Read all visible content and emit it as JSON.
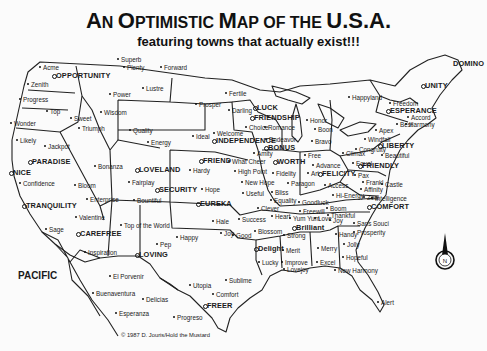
{
  "title": {
    "line1_parts": [
      "A",
      "N ",
      "O",
      "PTIMISTIC ",
      "M",
      "AP OF THE ",
      "U.S.A."
    ],
    "line2": "featuring towns that actually exist!!!"
  },
  "labels": [
    {
      "text": "Superb",
      "x": 121,
      "y": 56,
      "mk": "dot",
      "big": false
    },
    {
      "text": "Plenty",
      "x": 127,
      "y": 64,
      "mk": "dot",
      "big": false
    },
    {
      "text": "Forward",
      "x": 164,
      "y": 64,
      "mk": "dot",
      "big": false
    },
    {
      "text": "Acme",
      "x": 43,
      "y": 64,
      "mk": "dot",
      "big": false
    },
    {
      "text": "OPPORTUNITY",
      "x": 56,
      "y": 72,
      "mk": "ring",
      "big": true
    },
    {
      "text": "Zenith",
      "x": 31,
      "y": 81,
      "mk": "dot",
      "big": false
    },
    {
      "text": "Lustre",
      "x": 146,
      "y": 85,
      "mk": "dot",
      "big": false
    },
    {
      "text": "Power",
      "x": 113,
      "y": 91,
      "mk": "dot",
      "big": false
    },
    {
      "text": "Progress",
      "x": 23,
      "y": 96,
      "mk": "dot",
      "big": false
    },
    {
      "text": "Top",
      "x": 50,
      "y": 108,
      "mk": "dot",
      "big": false
    },
    {
      "text": "Wisdom",
      "x": 104,
      "y": 109,
      "mk": "dot",
      "big": false
    },
    {
      "text": "Sweet",
      "x": 74,
      "y": 115,
      "mk": "dot",
      "big": false
    },
    {
      "text": "Triumph",
      "x": 82,
      "y": 125,
      "mk": "dot",
      "big": false
    },
    {
      "text": "Wonder",
      "x": 14,
      "y": 120,
      "mk": "dot",
      "big": false
    },
    {
      "text": "Quality",
      "x": 133,
      "y": 127,
      "mk": "dot",
      "big": false
    },
    {
      "text": "Energy",
      "x": 151,
      "y": 139,
      "mk": "dot",
      "big": false
    },
    {
      "text": "Likely",
      "x": 20,
      "y": 137,
      "mk": "dot",
      "big": false
    },
    {
      "text": "Jackpot",
      "x": 48,
      "y": 143,
      "mk": "dot",
      "big": false
    },
    {
      "text": "PARADISE",
      "x": 32,
      "y": 158,
      "mk": "ring",
      "big": true
    },
    {
      "text": "NICE",
      "x": 13,
      "y": 169,
      "mk": "ring",
      "big": true
    },
    {
      "text": "Confidence",
      "x": 23,
      "y": 180,
      "mk": "dot",
      "big": false
    },
    {
      "text": "TRANQUILITY",
      "x": 26,
      "y": 202,
      "mk": "ring",
      "big": true
    },
    {
      "text": "Sage",
      "x": 49,
      "y": 226,
      "mk": "dot",
      "big": false
    },
    {
      "text": "Bonanza",
      "x": 98,
      "y": 163,
      "mk": "dot",
      "big": false
    },
    {
      "text": "Bloom",
      "x": 78,
      "y": 182,
      "mk": "dot",
      "big": false
    },
    {
      "text": "Enterprise",
      "x": 90,
      "y": 196,
      "mk": "dot",
      "big": false
    },
    {
      "text": "Valentine",
      "x": 79,
      "y": 214,
      "mk": "dot",
      "big": false
    },
    {
      "text": "CAREFREE",
      "x": 80,
      "y": 230,
      "mk": "ring",
      "big": true
    },
    {
      "text": "Inspiration",
      "x": 88,
      "y": 249,
      "mk": "dot",
      "big": false
    },
    {
      "text": "LOVELAND",
      "x": 139,
      "y": 166,
      "mk": "ring",
      "big": true
    },
    {
      "text": "Fairplay",
      "x": 132,
      "y": 179,
      "mk": "dot",
      "big": false
    },
    {
      "text": "SECURITY",
      "x": 159,
      "y": 186,
      "mk": "ring",
      "big": true
    },
    {
      "text": "Bountiful",
      "x": 137,
      "y": 197,
      "mk": "dot",
      "big": false
    },
    {
      "text": "Top of the World",
      "x": 124,
      "y": 222,
      "mk": "dot",
      "big": false
    },
    {
      "text": "Pep",
      "x": 160,
      "y": 241,
      "mk": "dot",
      "big": false
    },
    {
      "text": "LOVING",
      "x": 139,
      "y": 251,
      "mk": "ring",
      "big": true
    },
    {
      "text": "Happy",
      "x": 180,
      "y": 234,
      "mk": "dot",
      "big": false
    },
    {
      "text": "Ideal",
      "x": 196,
      "y": 133,
      "mk": "dot",
      "big": false
    },
    {
      "text": "Welcome",
      "x": 217,
      "y": 130,
      "mk": "dot",
      "big": false
    },
    {
      "text": "INDEPENDENCE",
      "x": 216,
      "y": 137,
      "mk": "ring",
      "big": true
    },
    {
      "text": "FRIEND",
      "x": 203,
      "y": 157,
      "mk": "ring",
      "big": true
    },
    {
      "text": "What Cheer",
      "x": 232,
      "y": 158,
      "mk": "dot",
      "big": false
    },
    {
      "text": "Hardy",
      "x": 193,
      "y": 167,
      "mk": "dot",
      "big": false
    },
    {
      "text": "High Point",
      "x": 238,
      "y": 168,
      "mk": "dot",
      "big": false
    },
    {
      "text": "Hope",
      "x": 205,
      "y": 186,
      "mk": "dot",
      "big": false
    },
    {
      "text": "EUREKA",
      "x": 200,
      "y": 200,
      "mk": "ring",
      "big": true
    },
    {
      "text": "Prosper",
      "x": 199,
      "y": 101,
      "mk": "dot",
      "big": false
    },
    {
      "text": "Fertile",
      "x": 229,
      "y": 90,
      "mk": "dot",
      "big": false
    },
    {
      "text": "Darling",
      "x": 232,
      "y": 107,
      "mk": "dot",
      "big": false
    },
    {
      "text": "LUCK",
      "x": 257,
      "y": 104,
      "mk": "ring",
      "big": true
    },
    {
      "text": "FRIENDSHIP",
      "x": 254,
      "y": 114,
      "mk": "ring",
      "big": true
    },
    {
      "text": "Choice",
      "x": 249,
      "y": 124,
      "mk": "dot",
      "big": false
    },
    {
      "text": "Romance",
      "x": 268,
      "y": 124,
      "mk": "dot",
      "big": false
    },
    {
      "text": "Endeavor",
      "x": 269,
      "y": 136,
      "mk": "dot",
      "big": false
    },
    {
      "text": "BONUS",
      "x": 268,
      "y": 144,
      "mk": "ring",
      "big": true
    },
    {
      "text": "Amity",
      "x": 257,
      "y": 150,
      "mk": "dot",
      "big": false
    },
    {
      "text": "WORTH",
      "x": 277,
      "y": 158,
      "mk": "ring",
      "big": true
    },
    {
      "text": "Fidelity",
      "x": 276,
      "y": 170,
      "mk": "dot",
      "big": false
    },
    {
      "text": "New Hope",
      "x": 245,
      "y": 179,
      "mk": "dot",
      "big": false
    },
    {
      "text": "Useful",
      "x": 246,
      "y": 190,
      "mk": "dot",
      "big": false
    },
    {
      "text": "Bliss",
      "x": 275,
      "y": 189,
      "mk": "dot",
      "big": false
    },
    {
      "text": "Paragon",
      "x": 291,
      "y": 180,
      "mk": "dot",
      "big": false
    },
    {
      "text": "Equality",
      "x": 274,
      "y": 197,
      "mk": "dot",
      "big": false
    },
    {
      "text": "Goodluck",
      "x": 302,
      "y": 199,
      "mk": "dot",
      "big": false
    },
    {
      "text": "Clever",
      "x": 261,
      "y": 205,
      "mk": "dot",
      "big": false
    },
    {
      "text": "Heart",
      "x": 275,
      "y": 213,
      "mk": "dot",
      "big": false
    },
    {
      "text": "Success",
      "x": 242,
      "y": 216,
      "mk": "dot",
      "big": false
    },
    {
      "text": "Hale",
      "x": 216,
      "y": 218,
      "mk": "dot",
      "big": false
    },
    {
      "text": "Joy",
      "x": 224,
      "y": 230,
      "mk": "dot",
      "big": false
    },
    {
      "text": "Good",
      "x": 236,
      "y": 232,
      "mk": "dot",
      "big": false
    },
    {
      "text": "Blossom",
      "x": 258,
      "y": 228,
      "mk": "dot",
      "big": false
    },
    {
      "text": "Delight",
      "x": 258,
      "y": 245,
      "mk": "ring",
      "big": true
    },
    {
      "text": "Lucky",
      "x": 262,
      "y": 259,
      "mk": "dot",
      "big": false
    },
    {
      "text": "Happyland",
      "x": 352,
      "y": 94,
      "mk": "dot",
      "big": false
    },
    {
      "text": "Honor",
      "x": 310,
      "y": 117,
      "mk": "dot",
      "big": false
    },
    {
      "text": "Boon",
      "x": 318,
      "y": 126,
      "mk": "dot",
      "big": false
    },
    {
      "text": "Bravo",
      "x": 315,
      "y": 138,
      "mk": "dot",
      "big": false
    },
    {
      "text": "Free",
      "x": 308,
      "y": 152,
      "mk": "dot",
      "big": false
    },
    {
      "text": "Advance",
      "x": 316,
      "y": 162,
      "mk": "dot",
      "big": false
    },
    {
      "text": "Art",
      "x": 311,
      "y": 170,
      "mk": "dot",
      "big": false
    },
    {
      "text": "FELICITY",
      "x": 322,
      "y": 170,
      "mk": "ring",
      "big": true
    },
    {
      "text": "Access",
      "x": 328,
      "y": 182,
      "mk": "dot",
      "big": false
    },
    {
      "text": "Hi-Energy",
      "x": 336,
      "y": 192,
      "mk": "dot",
      "big": false
    },
    {
      "text": "Climax",
      "x": 346,
      "y": 150,
      "mk": "dot",
      "big": false
    },
    {
      "text": "Equal",
      "x": 356,
      "y": 160,
      "mk": "dot",
      "big": false
    },
    {
      "text": "Pax",
      "x": 358,
      "y": 172,
      "mk": "dot",
      "big": false
    },
    {
      "text": "Frankl",
      "x": 366,
      "y": 179,
      "mk": "dot",
      "big": false
    },
    {
      "text": "Affinity",
      "x": 364,
      "y": 186,
      "mk": "dot",
      "big": false
    },
    {
      "text": "Zeal",
      "x": 367,
      "y": 194,
      "mk": "dot",
      "big": false
    },
    {
      "text": "Boom",
      "x": 330,
      "y": 205,
      "mk": "dot",
      "big": false
    },
    {
      "text": "Freewill",
      "x": 303,
      "y": 208,
      "mk": "dot",
      "big": false
    },
    {
      "text": "Thankful",
      "x": 331,
      "y": 212,
      "mk": "dot",
      "big": false
    },
    {
      "text": "Yum Yum",
      "x": 293,
      "y": 215,
      "mk": "dot",
      "big": false
    },
    {
      "text": "Love",
      "x": 318,
      "y": 215,
      "mk": "dot",
      "big": false
    },
    {
      "text": "Joy",
      "x": 333,
      "y": 217,
      "mk": "dot",
      "big": false
    },
    {
      "text": "Brilliant",
      "x": 296,
      "y": 224,
      "mk": "ring",
      "big": true
    },
    {
      "text": "Strong",
      "x": 287,
      "y": 232,
      "mk": "dot",
      "big": false
    },
    {
      "text": "Merit",
      "x": 286,
      "y": 247,
      "mk": "dot",
      "big": false
    },
    {
      "text": "Merry",
      "x": 321,
      "y": 245,
      "mk": "dot",
      "big": false
    },
    {
      "text": "Improve",
      "x": 285,
      "y": 259,
      "mk": "dot",
      "big": false
    },
    {
      "text": "Excel",
      "x": 320,
      "y": 259,
      "mk": "dot",
      "big": false
    },
    {
      "text": "Lovejoy",
      "x": 287,
      "y": 266,
      "mk": "dot",
      "big": false
    },
    {
      "text": "Handy",
      "x": 339,
      "y": 231,
      "mk": "dot",
      "big": false
    },
    {
      "text": "Jolly",
      "x": 347,
      "y": 241,
      "mk": "dot",
      "big": false
    },
    {
      "text": "Hopeful",
      "x": 346,
      "y": 254,
      "mk": "dot",
      "big": false
    },
    {
      "text": "New Harmony",
      "x": 338,
      "y": 267,
      "mk": "dot",
      "big": false
    },
    {
      "text": "Alert",
      "x": 381,
      "y": 299,
      "mk": "dot",
      "big": false
    },
    {
      "text": "UNITY",
      "x": 425,
      "y": 82,
      "mk": "ring",
      "big": true
    },
    {
      "text": "DOMINO",
      "x": 453,
      "y": 60,
      "mk": "none",
      "big": true
    },
    {
      "text": "Freedom",
      "x": 393,
      "y": 100,
      "mk": "dot",
      "big": false
    },
    {
      "text": "ESPERANCE",
      "x": 390,
      "y": 107,
      "mk": "ring",
      "big": true
    },
    {
      "text": "Accord",
      "x": 411,
      "y": 114,
      "mk": "dot",
      "big": false
    },
    {
      "text": "Best",
      "x": 400,
      "y": 121,
      "mk": "dot",
      "big": false
    },
    {
      "text": "Harmony",
      "x": 409,
      "y": 121,
      "mk": "dot",
      "big": false
    },
    {
      "text": "Apex",
      "x": 379,
      "y": 127,
      "mk": "dot",
      "big": false
    },
    {
      "text": "Windfall",
      "x": 368,
      "y": 136,
      "mk": "dot",
      "big": false
    },
    {
      "text": "LIBERTY",
      "x": 382,
      "y": 142,
      "mk": "ring",
      "big": true
    },
    {
      "text": "Congruity",
      "x": 359,
      "y": 146,
      "mk": "dot",
      "big": false
    },
    {
      "text": "Beautiful",
      "x": 385,
      "y": 152,
      "mk": "dot",
      "big": false
    },
    {
      "text": "FRIENDLY",
      "x": 362,
      "y": 162,
      "mk": "ring",
      "big": true
    },
    {
      "text": "Castle",
      "x": 385,
      "y": 181,
      "mk": "dot",
      "big": false
    },
    {
      "text": "Intelligence",
      "x": 375,
      "y": 195,
      "mk": "dot",
      "big": false
    },
    {
      "text": "COMFORT",
      "x": 371,
      "y": 203,
      "mk": "ring",
      "big": true
    },
    {
      "text": "Sans Souci",
      "x": 357,
      "y": 220,
      "mk": "dot",
      "big": false
    },
    {
      "text": "Prosperity",
      "x": 357,
      "y": 229,
      "mk": "dot",
      "big": false
    },
    {
      "text": "El Porvenir",
      "x": 113,
      "y": 273,
      "mk": "dot",
      "big": false
    },
    {
      "text": "Buenaventura",
      "x": 96,
      "y": 290,
      "mk": "dot",
      "big": false
    },
    {
      "text": "Delicias",
      "x": 146,
      "y": 296,
      "mk": "dot",
      "big": false
    },
    {
      "text": "Esperanza",
      "x": 119,
      "y": 310,
      "mk": "dot",
      "big": false
    },
    {
      "text": "Utopia",
      "x": 193,
      "y": 282,
      "mk": "dot",
      "big": false
    },
    {
      "text": "Sublime",
      "x": 229,
      "y": 277,
      "mk": "dot",
      "big": false
    },
    {
      "text": "Comfort",
      "x": 216,
      "y": 291,
      "mk": "dot",
      "big": false
    },
    {
      "text": "FREER",
      "x": 207,
      "y": 302,
      "mk": "ring",
      "big": true
    },
    {
      "text": "Progreso",
      "x": 177,
      "y": 314,
      "mk": "dot",
      "big": false
    }
  ],
  "sea_label": {
    "text": "PACIFIC",
    "x": 18,
    "y": 276
  },
  "copyright": {
    "text": "© 1987 D. Jouris/Hold the Mustard",
    "x": 121,
    "y": 335
  },
  "compass": {
    "icon": "north-arrow-icon",
    "letter": "N"
  }
}
